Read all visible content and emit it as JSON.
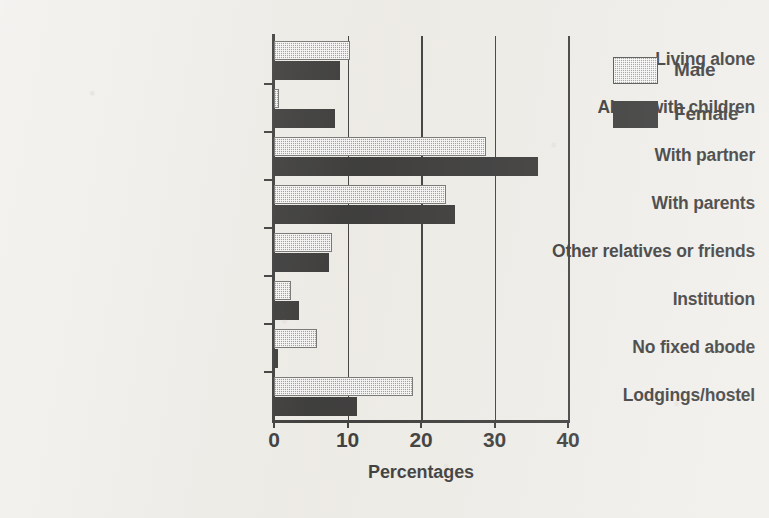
{
  "chart_data": {
    "type": "bar",
    "orientation": "horizontal",
    "title": "",
    "xlabel": "Percentages",
    "ylabel": "",
    "xlim": [
      0,
      40
    ],
    "xticks": [
      0,
      10,
      20,
      30,
      40
    ],
    "xtick_labels": [
      "0",
      "10",
      "20",
      "30",
      "40"
    ],
    "grid": true,
    "grid_axis": "x",
    "legend_position": "right",
    "categories": [
      "Living alone",
      "Alone with children",
      "With partner",
      "With parents",
      "Other relatives or friends",
      "Institution",
      "No fixed abode",
      "Lodgings/hostel"
    ],
    "series": [
      {
        "name": "Male",
        "color": "#8d8d8d",
        "values": [
          10.4,
          0.7,
          28.8,
          23.4,
          7.9,
          2.3,
          5.8,
          18.9
        ]
      },
      {
        "name": "Female",
        "color": "#121212",
        "values": [
          9.0,
          8.3,
          35.9,
          24.6,
          7.5,
          3.4,
          0.5,
          11.3
        ]
      }
    ]
  },
  "legend": {
    "items": [
      {
        "label": "Male",
        "swatch": "male-swatch"
      },
      {
        "label": "Female",
        "swatch": "female-swatch"
      }
    ]
  }
}
